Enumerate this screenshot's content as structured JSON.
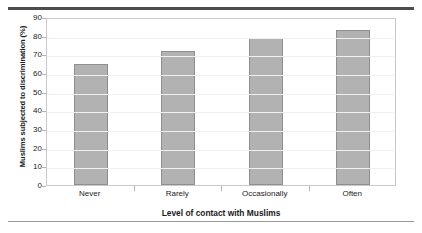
{
  "chart_data": {
    "type": "bar",
    "title": "",
    "categories": [
      "Never",
      "Rarely",
      "Occasionally",
      "Often"
    ],
    "values": [
      65,
      72,
      79,
      83
    ],
    "xlabel": "Level of contact with Muslims",
    "ylabel": "Muslims subjected to discrimination (%)",
    "ylim": [
      0,
      90
    ],
    "ytick_labels": [
      "0",
      "10",
      "20",
      "30",
      "40",
      "50",
      "60",
      "70",
      "80",
      "90"
    ],
    "ytick_values": [
      0,
      10,
      20,
      30,
      40,
      50,
      60,
      70,
      80,
      90
    ],
    "grid": true,
    "legend": false,
    "series": [
      {
        "name": "Muslims subjected to discrimination (%)",
        "values": [
          65,
          72,
          79,
          83
        ]
      }
    ],
    "colors": {
      "bar_fill": "#b2b2b2",
      "bar_border": "#8e8e8e",
      "gridline": "#f0f0f0",
      "frame": "#c9c9c9",
      "text": "#1a1a1a",
      "rule_top": "#4d4d4d",
      "rule_bottom": "#9a9a9a"
    }
  }
}
